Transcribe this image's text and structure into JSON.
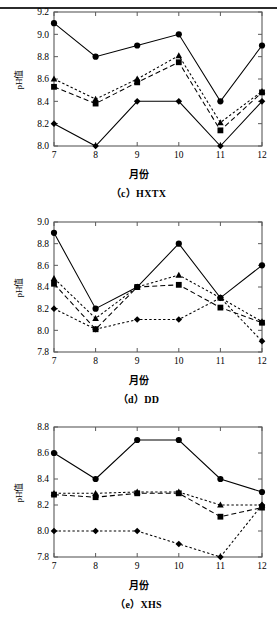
{
  "figure": {
    "top_rule": true,
    "panels": [
      {
        "id": "c",
        "caption": "（c）HXTX",
        "xlabel": "月份",
        "ylabel": "pH值",
        "chart_data": {
          "type": "line",
          "title": "（c）HXTX",
          "xlabel": "月份",
          "ylabel": "pH值",
          "x": [
            7,
            8,
            9,
            10,
            11,
            12
          ],
          "xticks": [
            "7",
            "8",
            "9",
            "10",
            "11",
            "12"
          ],
          "yticks": [
            "8.0",
            "8.2",
            "8.4",
            "8.6",
            "8.8",
            "9.0",
            "9.2"
          ],
          "ylim": [
            8.0,
            9.2
          ],
          "xlim": [
            7,
            12
          ],
          "grid": false,
          "legend": "none",
          "series": [
            {
              "name": "series-circle",
              "marker": "circle",
              "line": "solid",
              "values": [
                9.1,
                8.8,
                8.9,
                9.0,
                8.4,
                8.9
              ]
            },
            {
              "name": "series-triangle",
              "marker": "triangle",
              "line": "dotted",
              "values": [
                8.6,
                8.42,
                8.6,
                8.81,
                8.21,
                8.49
              ]
            },
            {
              "name": "series-square",
              "marker": "square",
              "line": "dashed",
              "values": [
                8.53,
                8.38,
                8.57,
                8.75,
                8.14,
                8.48
              ]
            },
            {
              "name": "series-diamond",
              "marker": "diamond",
              "line": "solid",
              "values": [
                8.2,
                8.0,
                8.4,
                8.4,
                8.0,
                8.4
              ]
            }
          ]
        }
      },
      {
        "id": "d",
        "caption": "（d）DD",
        "xlabel": "月份",
        "ylabel": "pH值",
        "chart_data": {
          "type": "line",
          "title": "（d）DD",
          "xlabel": "月份",
          "ylabel": "pH值",
          "x": [
            7,
            8,
            9,
            10,
            11,
            12
          ],
          "xticks": [
            "7",
            "8",
            "9",
            "10",
            "11",
            "12"
          ],
          "yticks": [
            "7.8",
            "8.0",
            "8.2",
            "8.4",
            "8.6",
            "8.8",
            "9.0"
          ],
          "ylim": [
            7.8,
            9.0
          ],
          "xlim": [
            7,
            12
          ],
          "grid": false,
          "legend": "none",
          "series": [
            {
              "name": "series-circle",
              "marker": "circle",
              "line": "solid",
              "values": [
                8.9,
                8.2,
                8.4,
                8.8,
                8.3,
                8.6
              ]
            },
            {
              "name": "series-triangle",
              "marker": "triangle",
              "line": "dotted",
              "values": [
                8.48,
                8.11,
                8.4,
                8.51,
                8.3,
                8.08
              ]
            },
            {
              "name": "series-square",
              "marker": "square",
              "line": "dashed",
              "values": [
                8.43,
                8.01,
                8.4,
                8.42,
                8.21,
                8.07
              ]
            },
            {
              "name": "series-diamond",
              "marker": "diamond",
              "line": "dotted",
              "values": [
                8.2,
                8.01,
                8.1,
                8.1,
                8.3,
                7.9
              ]
            }
          ]
        }
      },
      {
        "id": "e",
        "caption": "（e）XHS",
        "xlabel": "月份",
        "ylabel": "pH值",
        "chart_data": {
          "type": "line",
          "title": "（e）XHS",
          "xlabel": "月份",
          "ylabel": "pH值",
          "x": [
            7,
            8,
            9,
            10,
            11,
            12
          ],
          "xticks": [
            "7",
            "8",
            "9",
            "10",
            "11",
            "12"
          ],
          "yticks": [
            "7.8",
            "8.0",
            "8.2",
            "8.4",
            "8.6",
            "8.8"
          ],
          "ylim": [
            7.8,
            8.8
          ],
          "xlim": [
            7,
            12
          ],
          "grid": false,
          "legend": "none",
          "series": [
            {
              "name": "series-circle",
              "marker": "circle",
              "line": "solid",
              "values": [
                8.6,
                8.4,
                8.7,
                8.7,
                8.4,
                8.3
              ]
            },
            {
              "name": "series-triangle",
              "marker": "triangle",
              "line": "dotted",
              "values": [
                8.29,
                8.29,
                8.3,
                8.3,
                8.2,
                8.2
              ]
            },
            {
              "name": "series-square",
              "marker": "square",
              "line": "dashed",
              "values": [
                8.28,
                8.26,
                8.29,
                8.29,
                8.11,
                8.18
              ]
            },
            {
              "name": "series-diamond",
              "marker": "diamond",
              "line": "dotted",
              "values": [
                8.0,
                8.0,
                8.0,
                7.9,
                7.8,
                8.2
              ]
            }
          ]
        }
      }
    ]
  },
  "colors": {
    "ink": "#000000",
    "axis": "#444444",
    "rule": "#2b2b2b",
    "background": "#ffffff"
  }
}
